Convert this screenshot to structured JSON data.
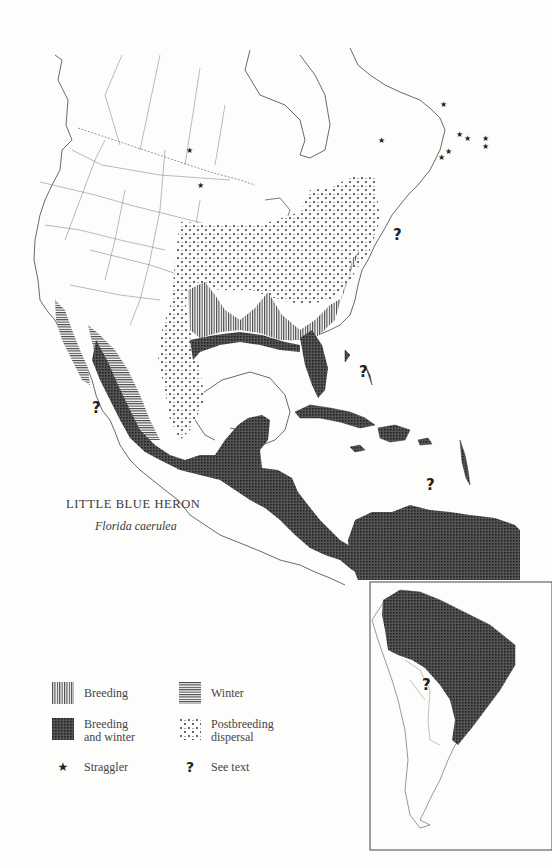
{
  "map": {
    "title": "LITTLE BLUE HERON",
    "subtitle": "Florida caerulea",
    "inset": "South America",
    "markers": {
      "question_marks": [
        {
          "x": 397,
          "y": 232
        },
        {
          "x": 97,
          "y": 405
        },
        {
          "x": 363,
          "y": 369
        },
        {
          "x": 430,
          "y": 482
        },
        {
          "x": 426,
          "y": 682
        }
      ],
      "stars": [
        {
          "x": 188,
          "y": 149
        },
        {
          "x": 200,
          "y": 184
        },
        {
          "x": 442,
          "y": 103
        },
        {
          "x": 380,
          "y": 139
        },
        {
          "x": 458,
          "y": 133
        },
        {
          "x": 466,
          "y": 136
        },
        {
          "x": 485,
          "y": 137
        },
        {
          "x": 485,
          "y": 145
        },
        {
          "x": 440,
          "y": 156
        },
        {
          "x": 447,
          "y": 150
        }
      ]
    }
  },
  "legend": {
    "items": [
      {
        "key": "breeding",
        "label": "Breeding",
        "pattern": "vertical-lines"
      },
      {
        "key": "winter",
        "label": "Winter",
        "pattern": "horizontal-lines"
      },
      {
        "key": "breeding_winter",
        "label_line1": "Breeding",
        "label_line2": "and winter",
        "pattern": "grid"
      },
      {
        "key": "postbreeding",
        "label_line1": "Postbreeding",
        "label_line2": "dispersal",
        "pattern": "dots"
      },
      {
        "key": "straggler",
        "label": "Straggler",
        "symbol": "★"
      },
      {
        "key": "see_text",
        "label": "See text",
        "symbol": "?"
      }
    ]
  },
  "colors": {
    "ink": "#333333",
    "fill_dark": "#3a3a3a",
    "paper": "#fdfdfc"
  }
}
